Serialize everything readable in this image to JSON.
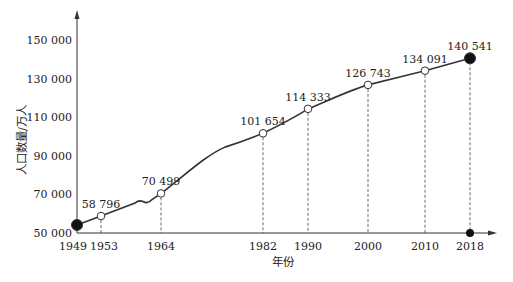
{
  "chart_data": {
    "type": "line",
    "title": "",
    "xlabel": "年份",
    "ylabel": "人口数量/万人",
    "ylim": [
      50000,
      150000
    ],
    "yticks": [
      50000,
      70000,
      90000,
      110000,
      130000,
      150000
    ],
    "ytick_labels": [
      "50 000",
      "70 000",
      "90 000",
      "110 000",
      "130 000",
      "150 000"
    ],
    "xticks": [
      1949,
      1953,
      1964,
      1982,
      1990,
      2000,
      2010,
      2018
    ],
    "xtick_labels": [
      "1949",
      "1953",
      "1964",
      "1982",
      "1990",
      "2000",
      "2010",
      "2018"
    ],
    "grid": false,
    "legend": null,
    "series": [
      {
        "name": "人口数量",
        "points": [
          {
            "x": 1949,
            "y": 54167,
            "label": "",
            "marker": "filled"
          },
          {
            "x": 1953,
            "y": 58796,
            "label": "58 796",
            "marker": "hollow"
          },
          {
            "x": 1964,
            "y": 70499,
            "label": "70 499",
            "marker": "hollow"
          },
          {
            "x": 1982,
            "y": 101654,
            "label": "101 654",
            "marker": "hollow"
          },
          {
            "x": 1990,
            "y": 114333,
            "label": "114 333",
            "marker": "hollow"
          },
          {
            "x": 2000,
            "y": 126743,
            "label": "126 743",
            "marker": "hollow"
          },
          {
            "x": 2010,
            "y": 134091,
            "label": "134 091",
            "marker": "hollow"
          },
          {
            "x": 2018,
            "y": 140541,
            "label": "140 541",
            "marker": "filled"
          }
        ]
      }
    ],
    "annotations": [
      "dashed drop lines from each labeled point to the x-axis",
      "filled dot on x-axis at 2018"
    ]
  }
}
